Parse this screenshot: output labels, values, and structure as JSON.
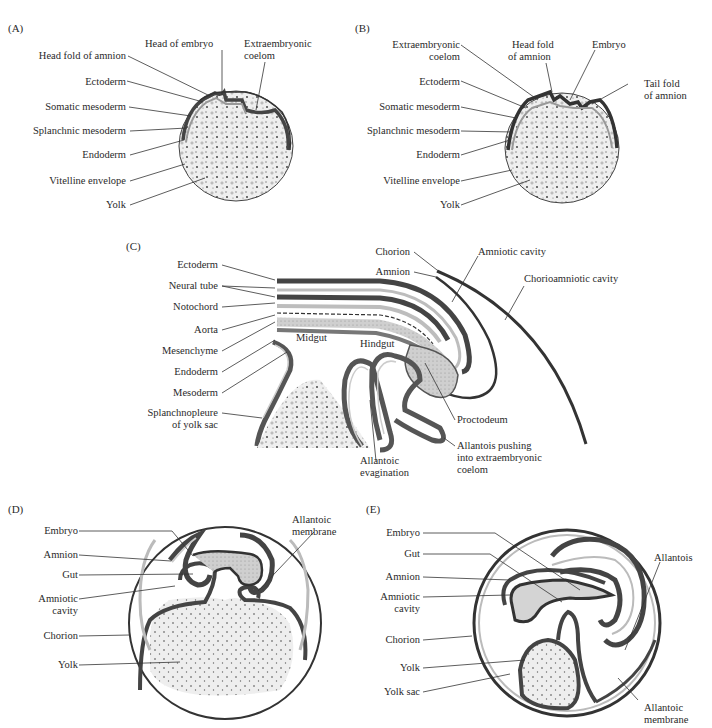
{
  "panels": {
    "A": {
      "label": "(A)",
      "labels": {
        "head_fold_of_amnion": "Head fold of amnion",
        "head_of_embryo": "Head of embryo",
        "extraembryonic_coelom_1": "Extraembryonic",
        "extraembryonic_coelom_2": "coelom",
        "ectoderm": "Ectoderm",
        "somatic_mesoderm": "Somatic mesoderm",
        "splanchnic_mesoderm": "Splanchnic mesoderm",
        "endoderm": "Endoderm",
        "vitelline_envelope": "Vitelline envelope",
        "yolk": "Yolk"
      }
    },
    "B": {
      "label": "(B)",
      "labels": {
        "extraembryonic_coelom_1": "Extraembryonic",
        "extraembryonic_coelom_2": "coelom",
        "head_fold_1": "Head fold",
        "head_fold_2": "of amnion",
        "embryo": "Embryo",
        "tail_fold_1": "Tail fold",
        "tail_fold_2": "of amnion",
        "ectoderm": "Ectoderm",
        "somatic_mesoderm": "Somatic mesoderm",
        "splanchnic_mesoderm": "Splanchnic mesoderm",
        "endoderm": "Endoderm",
        "vitelline_envelope": "Vitelline envelope",
        "yolk": "Yolk"
      }
    },
    "C": {
      "label": "(C)",
      "labels": {
        "ectoderm": "Ectoderm",
        "neural_tube": "Neural tube",
        "notochord": "Notochord",
        "aorta": "Aorta",
        "mesenchyme": "Mesenchyme",
        "endoderm": "Endoderm",
        "mesoderm": "Mesoderm",
        "splanchnopleure_1": "Splanchnopleure",
        "splanchnopleure_2": "of yolk sac",
        "midgut": "Midgut",
        "hindgut": "Hindgut",
        "chorion": "Chorion",
        "amnion": "Amnion",
        "amniotic_cavity": "Amniotic cavity",
        "chorioamniotic_cavity": "Chorioamniotic cavity",
        "proctodeum": "Proctodeum",
        "allantois_pushing_1": "Allantois pushing",
        "allantois_pushing_2": "into extraembryonic",
        "allantois_pushing_3": "coelom",
        "allantoic_evagination_1": "Allantoic",
        "allantoic_evagination_2": "evagination"
      }
    },
    "D": {
      "label": "(D)",
      "labels": {
        "embryo": "Embryo",
        "amnion": "Amnion",
        "gut": "Gut",
        "amniotic_cavity_1": "Amniotic",
        "amniotic_cavity_2": "cavity",
        "chorion": "Chorion",
        "yolk": "Yolk",
        "allantoic_membrane_1": "Allantoic",
        "allantoic_membrane_2": "membrane"
      }
    },
    "E": {
      "label": "(E)",
      "labels": {
        "embryo": "Embryo",
        "gut": "Gut",
        "amnion": "Amnion",
        "amniotic_cavity_1": "Amniotic",
        "amniotic_cavity_2": "cavity",
        "chorion": "Chorion",
        "yolk": "Yolk",
        "yolk_sac": "Yolk sac",
        "allantois": "Allantois",
        "allantoic_membrane_1": "Allantoic",
        "allantoic_membrane_2": "membrane"
      }
    }
  },
  "colors": {
    "ink": "#2a2a2a",
    "dark_layer": "#4a4a4a",
    "mid_layer": "#8a8a8a",
    "light_fill": "#d9d9d9",
    "yolk_fill": "#eeeeee",
    "background": "#ffffff"
  }
}
